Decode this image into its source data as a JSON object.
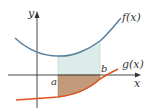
{
  "diagram": {
    "labels": {
      "y_axis": "y",
      "x_axis": "x",
      "f": "f(x)",
      "g": "g(x)",
      "a": "a",
      "b": "b"
    },
    "colors": {
      "f_curve": "#5a7f9e",
      "g_curve": "#e0541f",
      "upper_region": "#dcecea",
      "lower_region": "#c49a7c",
      "axes": "#333333"
    }
  }
}
